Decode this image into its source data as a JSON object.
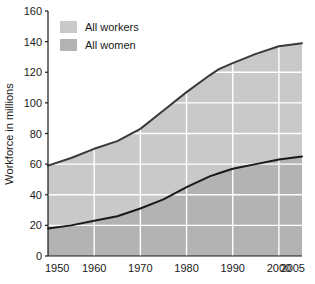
{
  "chart_data": {
    "type": "area",
    "title": "",
    "subtitle": "",
    "xlabel": "",
    "ylabel": "Workforce in millions",
    "xlim": [
      1950,
      2005
    ],
    "ylim": [
      0,
      160
    ],
    "grid": true,
    "grid_color": "#ffffff",
    "plot_background": "#c9c9c9",
    "legend_position": "top-left-inside",
    "x_tick_labels": [
      "1950",
      "1960",
      "1970",
      "1980",
      "1990",
      "2000",
      "2005"
    ],
    "x_ticks": [
      1950,
      1960,
      1970,
      1980,
      1990,
      2000,
      2005
    ],
    "y_tick_labels": [
      "0",
      "20",
      "40",
      "60",
      "80",
      "100",
      "120",
      "140",
      "160"
    ],
    "y_ticks": [
      0,
      20,
      40,
      60,
      80,
      100,
      120,
      140,
      160
    ],
    "x": [
      1950,
      1955,
      1960,
      1965,
      1970,
      1975,
      1980,
      1985,
      1987,
      1990,
      1995,
      2000,
      2005
    ],
    "series": [
      {
        "name": "All workers",
        "swatch_color": "#c9c9c9",
        "line_color": "#3a3a3a",
        "fill_color": "#c9c9c9",
        "values": [
          59,
          64,
          70,
          75,
          83,
          95,
          107,
          118,
          122,
          126,
          132,
          137,
          139
        ]
      },
      {
        "name": "All women",
        "swatch_color": "#b3b3b3",
        "line_color": "#1a1a1a",
        "fill_color": "#b3b3b3",
        "values": [
          18,
          20,
          23,
          26,
          31,
          37,
          45,
          52,
          54,
          57,
          60,
          63,
          65
        ]
      }
    ]
  },
  "legend": {
    "items": [
      {
        "label": "All workers"
      },
      {
        "label": "All women"
      }
    ]
  },
  "axes": {
    "y_axis_title": "Workforce in millions"
  }
}
